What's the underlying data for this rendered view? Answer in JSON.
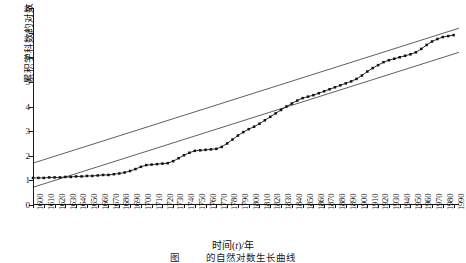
{
  "chart_data": {
    "type": "line",
    "title": "",
    "xlabel": "时间(t)/年",
    "ylabel": "累积学科数的对数（lnM）",
    "xlim": [
      1600,
      1995
    ],
    "ylim": [
      0,
      8
    ],
    "yticks": [
      0,
      1,
      2,
      3,
      4,
      5,
      6,
      7,
      8
    ],
    "xticks": [
      1600,
      1610,
      1620,
      1630,
      1640,
      1650,
      1660,
      1670,
      1680,
      1690,
      1700,
      1710,
      1720,
      1730,
      1740,
      1750,
      1760,
      1770,
      1780,
      1790,
      1800,
      1810,
      1820,
      1830,
      1840,
      1850,
      1860,
      1870,
      1880,
      1890,
      1900,
      1910,
      1920,
      1930,
      1940,
      1950,
      1960,
      1970,
      1980,
      1990
    ],
    "grid": false,
    "legend": null,
    "series": [
      {
        "name": "累积学科数的对数",
        "marker": "filled-square",
        "x": [
          1600,
          1605,
          1610,
          1615,
          1620,
          1625,
          1630,
          1635,
          1640,
          1645,
          1650,
          1655,
          1660,
          1665,
          1670,
          1675,
          1680,
          1685,
          1690,
          1695,
          1700,
          1705,
          1710,
          1715,
          1720,
          1725,
          1730,
          1735,
          1740,
          1745,
          1750,
          1755,
          1760,
          1765,
          1770,
          1775,
          1780,
          1785,
          1790,
          1795,
          1800,
          1805,
          1810,
          1815,
          1820,
          1825,
          1830,
          1835,
          1840,
          1845,
          1850,
          1855,
          1860,
          1865,
          1870,
          1875,
          1880,
          1885,
          1890,
          1895,
          1900,
          1905,
          1910,
          1915,
          1920,
          1925,
          1930,
          1935,
          1940,
          1945,
          1950,
          1955,
          1960,
          1965,
          1970,
          1975,
          1980,
          1985,
          1990
        ],
        "y": [
          1.1,
          1.1,
          1.1,
          1.12,
          1.12,
          1.12,
          1.14,
          1.14,
          1.16,
          1.16,
          1.18,
          1.18,
          1.2,
          1.22,
          1.22,
          1.25,
          1.28,
          1.32,
          1.38,
          1.46,
          1.55,
          1.62,
          1.64,
          1.66,
          1.68,
          1.7,
          1.78,
          1.9,
          2.02,
          2.12,
          2.2,
          2.22,
          2.24,
          2.26,
          2.28,
          2.36,
          2.5,
          2.66,
          2.82,
          2.96,
          3.08,
          3.18,
          3.3,
          3.44,
          3.58,
          3.72,
          3.86,
          4.0,
          4.12,
          4.24,
          4.34,
          4.4,
          4.46,
          4.54,
          4.62,
          4.7,
          4.78,
          4.86,
          4.94,
          5.02,
          5.12,
          5.26,
          5.42,
          5.56,
          5.68,
          5.8,
          5.88,
          5.94,
          6.0,
          6.06,
          6.12,
          6.2,
          6.34,
          6.5,
          6.64,
          6.74,
          6.82,
          6.86,
          6.9
        ]
      },
      {
        "name": "上包络线",
        "type": "straight-envelope",
        "x": [
          1600,
          1995
        ],
        "y": [
          1.7,
          7.18
        ]
      },
      {
        "name": "下包络线",
        "type": "straight-envelope",
        "x": [
          1600,
          1995
        ],
        "y": [
          0.72,
          6.2
        ]
      }
    ],
    "annotations": []
  },
  "axis": {
    "y_title": "累积学科数的对数（lnM）",
    "x_title_pre": "时间(",
    "x_title_ital": "t",
    "x_title_post": ")/年"
  },
  "caption": {
    "number": "图",
    "text": "的自然对数生长曲线"
  }
}
